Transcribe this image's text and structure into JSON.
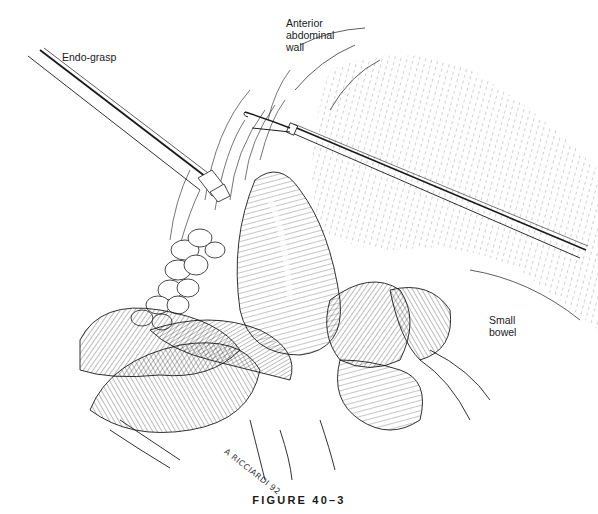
{
  "figure": {
    "caption": "FIGURE 40–3",
    "signature": "A RICCIARDI 92",
    "ink_color": "#1a1a1a",
    "background_color": "#ffffff"
  },
  "labels": {
    "endo_grasp": "Endo-grasp",
    "anterior_abdominal_wall": "Anterior\nabdominal\nwall",
    "small_bowel": "Small\nbowel"
  },
  "structures": [
    "endo-grasp-instrument",
    "second-grasping-instrument",
    "anterior-abdominal-wall",
    "omental-fat",
    "hernia-sac",
    "small-bowel-loops"
  ]
}
